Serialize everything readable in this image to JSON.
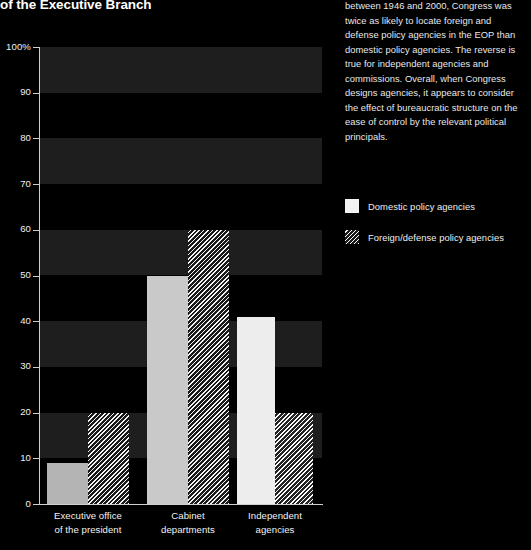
{
  "title": "of the Executive Branch",
  "body_text": "between 1946 and 2000, Congress was twice as likely to locate foreign and defense policy agencies in the EOP than domestic policy agencies. The reverse is true for independent agencies and commissions. Overall, when Congress designs agencies, it appears to consider the effect of bureaucratic structure on the ease of control by the relevant political principals.",
  "legend": {
    "items": [
      {
        "label": "Domestic policy agencies",
        "swatch": "solid-white"
      },
      {
        "label": "Foreign/defense policy agencies",
        "swatch": "diagonal-hatch"
      }
    ]
  },
  "chart_data": {
    "type": "bar",
    "title": "of the Executive Branch",
    "xlabel": "",
    "ylabel": "",
    "ylim": [
      0,
      100
    ],
    "y_unit": "%",
    "grid": "horizontal-alternating-bands",
    "legend_position": "right",
    "categories": [
      "Executive office of the president",
      "Cabinet departments",
      "Independent agencies"
    ],
    "category_lines": [
      [
        "Executive office",
        "of the president"
      ],
      [
        "Cabinet",
        "departments"
      ],
      [
        "Independent",
        "agencies"
      ]
    ],
    "series": [
      {
        "name": "Domestic policy agencies",
        "values": [
          9,
          50,
          41
        ]
      },
      {
        "name": "Foreign/defense policy agencies",
        "values": [
          20,
          60,
          20
        ]
      }
    ],
    "yticks": [
      "0",
      "10",
      "20",
      "30",
      "40",
      "50",
      "60",
      "70",
      "80",
      "90",
      "100%"
    ],
    "ytick_values": [
      0,
      10,
      20,
      30,
      40,
      50,
      60,
      70,
      80,
      90,
      100
    ]
  },
  "colors": {
    "background": "#000000",
    "band": "#1e1e1e",
    "axis": "#cfcfcf",
    "text": "#ffffff",
    "bar_solid": "#d0d0d0",
    "bar_hatch": "#f4f4f4"
  }
}
